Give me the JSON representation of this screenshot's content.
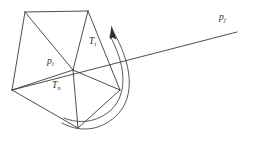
{
  "figure": {
    "type": "geometric-diagram",
    "background_color": "#ffffff",
    "line_color": "#3a3a3a",
    "text_color": "#2b2b2b",
    "labels": [
      {
        "id": "pi",
        "base": "p",
        "sub": "i",
        "x": 47,
        "y": 57
      },
      {
        "id": "pj",
        "base": "p",
        "sub": "j",
        "x": 219,
        "y": 13
      },
      {
        "id": "ti",
        "base": "T",
        "sub": "i",
        "x": 89,
        "y": 37
      },
      {
        "id": "tn",
        "base": "T",
        "sub": "n",
        "x": 52,
        "y": 81
      }
    ],
    "geometry": {
      "center": {
        "name": "p_i",
        "x": 73,
        "y": 70
      },
      "polygon_vertices": [
        {
          "name": "v-top-left",
          "x": 25,
          "y": 12
        },
        {
          "name": "v-top",
          "x": 88,
          "y": 11
        },
        {
          "name": "v-right",
          "x": 120,
          "y": 90
        },
        {
          "name": "v-bottom",
          "x": 78,
          "y": 128
        },
        {
          "name": "v-left",
          "x": 12,
          "y": 90
        }
      ],
      "ray": {
        "name": "ray-to-pj",
        "from_x": 12,
        "from_y": 90,
        "to_x": 237,
        "to_y": 32
      },
      "arc": {
        "name": "sweep-arc",
        "start_x": 113,
        "start_y": 30,
        "end_x": 62,
        "end_y": 123,
        "arrow_tip_x": 112,
        "arrow_tip_y": 26
      }
    }
  }
}
